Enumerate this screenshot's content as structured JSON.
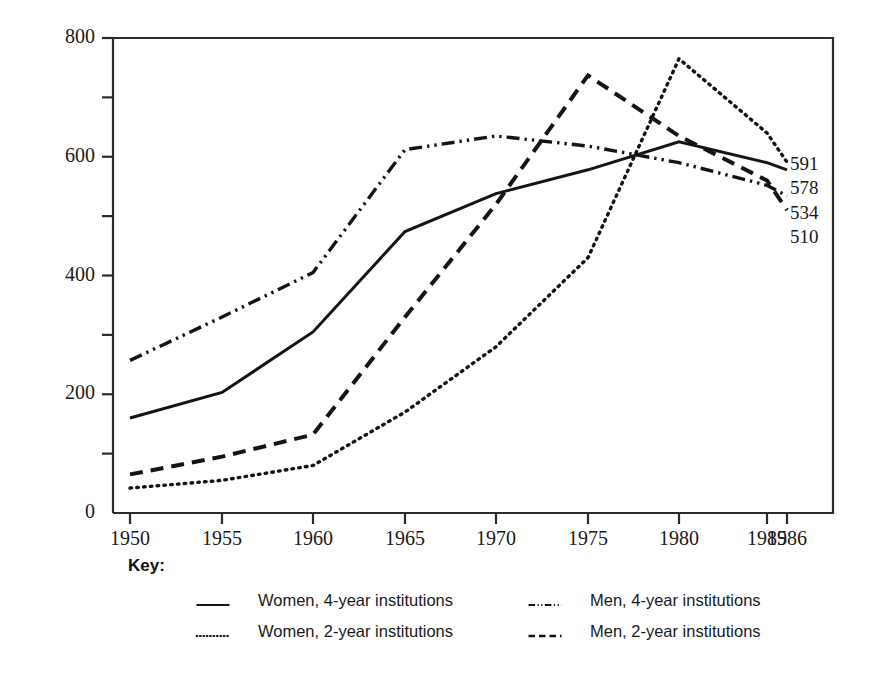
{
  "figure": {
    "y_axis_title": "First-Time Freshman Enrollments (in thousands)",
    "key_title": "Key:"
  },
  "legend": {
    "position": "below-plot",
    "entries": [
      {
        "label": "Women, 4-year institutions",
        "style": "solid"
      },
      {
        "label": "Women, 2-year institutions",
        "style": "dotted"
      },
      {
        "label": "Men, 4-year institutions",
        "style": "dash-dot-dot"
      },
      {
        "label": "Men, 2-year institutions",
        "style": "dashed"
      }
    ]
  },
  "end_labels": [
    {
      "value": "591",
      "series": "Women, 2-year institutions"
    },
    {
      "value": "578",
      "series": "Women, 4-year institutions"
    },
    {
      "value": "534",
      "series": "Men, 4-year institutions"
    },
    {
      "value": "510",
      "series": "Men, 2-year institutions"
    }
  ],
  "chart_data": {
    "type": "line",
    "title": "",
    "xlabel": "",
    "ylabel": "First-Time Freshman Enrollments (in thousands)",
    "grid": false,
    "legend_position": "bottom",
    "xlim": [
      1950,
      1986
    ],
    "ylim": [
      0,
      800
    ],
    "ytick_labels": [
      "0",
      "200",
      "400",
      "600",
      "800"
    ],
    "ytick_values": [
      0,
      200,
      400,
      600,
      800
    ],
    "yminor_values": [
      100,
      300,
      500,
      700
    ],
    "xtick_labels": [
      "1950",
      "1955",
      "1960",
      "1965",
      "1970",
      "1975",
      "1980",
      "1985",
      "1986"
    ],
    "x": [
      1950,
      1955,
      1960,
      1965,
      1970,
      1975,
      1980,
      1985,
      1986
    ],
    "series": [
      {
        "name": "Women, 4-year institutions",
        "style": "solid",
        "color": "#141414",
        "values": [
          160,
          203,
          305,
          474,
          538,
          578,
          625,
          590,
          578
        ]
      },
      {
        "name": "Women, 2-year institutions",
        "style": "dotted",
        "color": "#141414",
        "values": [
          42,
          55,
          80,
          170,
          280,
          430,
          765,
          640,
          591
        ]
      },
      {
        "name": "Men, 4-year institutions",
        "style": "dash-dot-dot",
        "color": "#141414",
        "values": [
          257,
          330,
          405,
          612,
          635,
          618,
          590,
          552,
          534
        ]
      },
      {
        "name": "Men, 2-year institutions",
        "style": "dashed",
        "color": "#141414",
        "values": [
          65,
          95,
          132,
          330,
          520,
          737,
          635,
          560,
          510
        ]
      }
    ]
  }
}
